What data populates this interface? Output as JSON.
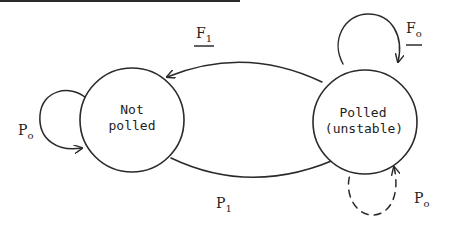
{
  "diagram": {
    "type": "state-transition",
    "stroke_color": "#2a2a2a",
    "nodes": [
      {
        "id": "not-polled",
        "line1": "Not",
        "line2": "polled"
      },
      {
        "id": "polled-unstable",
        "line1": "Polled",
        "line2": "(unstable)"
      }
    ],
    "edges": [
      {
        "id": "f1",
        "from": "polled-unstable",
        "to": "not-polled",
        "label": "F",
        "subscript": "1",
        "underlined": true,
        "style": "solid"
      },
      {
        "id": "p1",
        "from": "not-polled",
        "to": "polled-unstable",
        "label": "P",
        "subscript": "1",
        "underlined": false,
        "style": "solid"
      },
      {
        "id": "p0-left",
        "from": "not-polled",
        "to": "not-polled",
        "label": "P",
        "subscript": "o",
        "underlined": false,
        "style": "solid"
      },
      {
        "id": "f0",
        "from": "polled-unstable",
        "to": "polled-unstable",
        "label": "F",
        "subscript": "o",
        "underlined": true,
        "style": "solid"
      },
      {
        "id": "p0-right",
        "from": "polled-unstable",
        "to": "polled-unstable",
        "label": "P",
        "subscript": "o",
        "underlined": false,
        "style": "dashed"
      }
    ]
  }
}
